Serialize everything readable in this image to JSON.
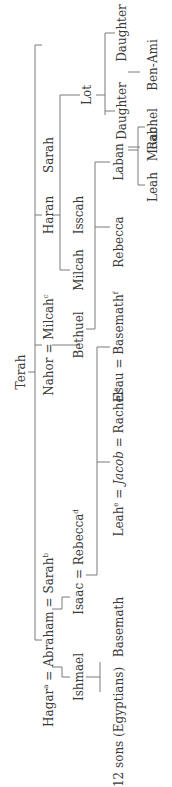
{
  "diagram": {
    "orientation": "rotated 90 degrees counterclockwise",
    "line_color": "#7a7a7a",
    "text_color": "#3a3a3a",
    "nodes": {
      "terah": "Terah",
      "hagar": "Hagar",
      "hagar_sup": "a",
      "eq1": "=",
      "abraham": "Abraham",
      "eq2": "=",
      "sarah_wife": "Sarah",
      "sarah_wife_sup": "b",
      "nahor": "Nahor",
      "eq3": "=",
      "milcah_wife": "Milcah",
      "milcah_wife_sup": "c",
      "haran": "Haran",
      "sarah": "Sarah",
      "lot": "Lot",
      "ishmael": "Ishmael",
      "isaac": "Isaac",
      "eq4": "=",
      "rebecca_wife": "Rebecca",
      "rebecca_wife_sup": "d",
      "bethuel": "Bethuel",
      "milcah": "Milcah",
      "isscah": "Isscah",
      "daughter1": "Daughter",
      "daughter2": "Daughter",
      "twelve_sons": "12 sons (Egyptians)",
      "basemath": "Basemath",
      "leah_wife": "Leah",
      "leah_wife_sup": "e",
      "eq5": "=",
      "jacob": "Jacob",
      "eq6": "=",
      "rachel_wife": "Rachel",
      "rachel_wife_sup": "e",
      "esau": "Esau",
      "eq7": "=",
      "basemath_wife": "Basemath",
      "basemath_wife_sup": "f",
      "rebecca": "Rebecca",
      "laban": "Laban",
      "moab": "Moab",
      "ben_ami": "Ben-Ami",
      "leah": "Leah",
      "rachel": "Rachel"
    }
  }
}
